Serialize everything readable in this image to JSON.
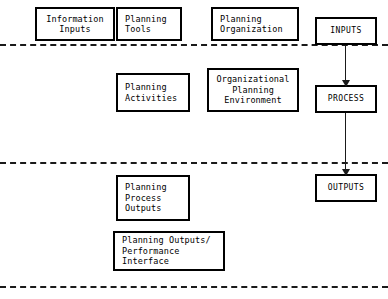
{
  "diagram": {
    "type": "flow-diagram",
    "stroke_color": "#000000",
    "background_color": "#ffffff",
    "bands": [
      {
        "name": "inputs-band",
        "divider_y": 44
      },
      {
        "name": "process-band",
        "divider_y": 162
      },
      {
        "name": "outputs-band",
        "divider_y": 286
      }
    ],
    "nodes": {
      "information_inputs": {
        "lines": [
          "Information",
          "Inputs"
        ]
      },
      "planning_tools": {
        "lines": [
          "Planning",
          "Tools"
        ]
      },
      "planning_organization": {
        "lines": [
          "Planning",
          "Organization"
        ]
      },
      "inputs": {
        "lines": [
          "INPUTS"
        ]
      },
      "planning_activities": {
        "lines": [
          "Planning",
          "Activities"
        ]
      },
      "organizational_planning_environment": {
        "lines": [
          "Organizational",
          "Planning",
          "Environment"
        ]
      },
      "process": {
        "lines": [
          "PROCESS"
        ]
      },
      "planning_process_outputs": {
        "lines": [
          "Planning",
          "Process",
          "Outputs"
        ]
      },
      "planning_outputs_performance_interface": {
        "lines": [
          "Planning Outputs/",
          "Performance",
          "Interface"
        ]
      },
      "outputs": {
        "lines": [
          "OUTPUTS"
        ]
      }
    },
    "connectors": [
      {
        "name": "inputs-to-process",
        "from": "inputs",
        "to": "process"
      },
      {
        "name": "process-to-outputs",
        "from": "process",
        "to": "outputs"
      }
    ]
  }
}
